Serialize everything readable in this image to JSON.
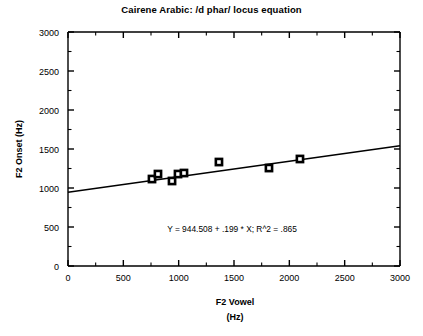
{
  "chart_data": {
    "type": "scatter",
    "title": "Cairene Arabic: /d phar/ locus equation",
    "xlabel": "F2 Vowel",
    "xlabel_unit": "(Hz)",
    "ylabel": "F2 Onset (Hz)",
    "xlim": [
      0,
      3000
    ],
    "ylim": [
      0,
      3000
    ],
    "xticks": [
      0,
      500,
      1000,
      1500,
      2000,
      2500,
      3000
    ],
    "yticks": [
      0,
      500,
      1000,
      1500,
      2000,
      2500,
      3000
    ],
    "xtick_labels": [
      "0",
      "500",
      "1000",
      "1500",
      "2000",
      "2500",
      "3000"
    ],
    "ytick_labels": [
      "0",
      "500",
      "1000",
      "1500",
      "2000",
      "2500",
      "3000"
    ],
    "minor_tick_interval": 250,
    "grid": false,
    "legend": "none",
    "marker_style": "open-square",
    "points": [
      {
        "x": 759,
        "y": 1115
      },
      {
        "x": 813,
        "y": 1179
      },
      {
        "x": 940,
        "y": 1090
      },
      {
        "x": 994,
        "y": 1179
      },
      {
        "x": 1048,
        "y": 1192
      },
      {
        "x": 1364,
        "y": 1333
      },
      {
        "x": 1816,
        "y": 1256
      },
      {
        "x": 2096,
        "y": 1372
      }
    ],
    "series": [
      {
        "name": "/d phar/ onsets",
        "x": [
          759,
          813,
          940,
          994,
          1048,
          1364,
          1816,
          2096
        ],
        "values": [
          1115,
          1179,
          1090,
          1179,
          1192,
          1333,
          1256,
          1372
        ]
      }
    ],
    "regression": {
      "intercept": 944.508,
      "slope": 0.199,
      "r_squared": 0.865,
      "annotation": "Y = 944.508 + .199 * X; R^2 = .865",
      "line_endpoints": [
        {
          "x": 0,
          "y": 944.508
        },
        {
          "x": 3000,
          "y": 1541.508
        }
      ]
    },
    "colors": {
      "axis": "#000000",
      "marker_edge": "#000000",
      "marker_fill": "#ffffff",
      "fit_line": "#000000",
      "background": "#ffffff"
    }
  }
}
